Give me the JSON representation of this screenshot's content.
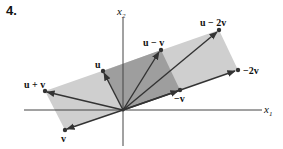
{
  "problem": {
    "number": "4."
  },
  "axes": {
    "x_label": "x",
    "x_sub": "1",
    "y_label": "x",
    "y_sub": "2"
  },
  "colors": {
    "light_region": "#c8c8c8",
    "dark_region": "#9a9a9a",
    "vector": "#333333",
    "axis": "#444444"
  },
  "vectors": [
    {
      "name": "u",
      "label": "u"
    },
    {
      "name": "u-v",
      "label": "u − v"
    },
    {
      "name": "u-2v",
      "label": "u − 2v"
    },
    {
      "name": "-2v",
      "label": "−2v"
    },
    {
      "name": "-v",
      "label": "−v"
    },
    {
      "name": "v",
      "label": "v"
    },
    {
      "name": "u+v",
      "label": "u + v"
    }
  ]
}
